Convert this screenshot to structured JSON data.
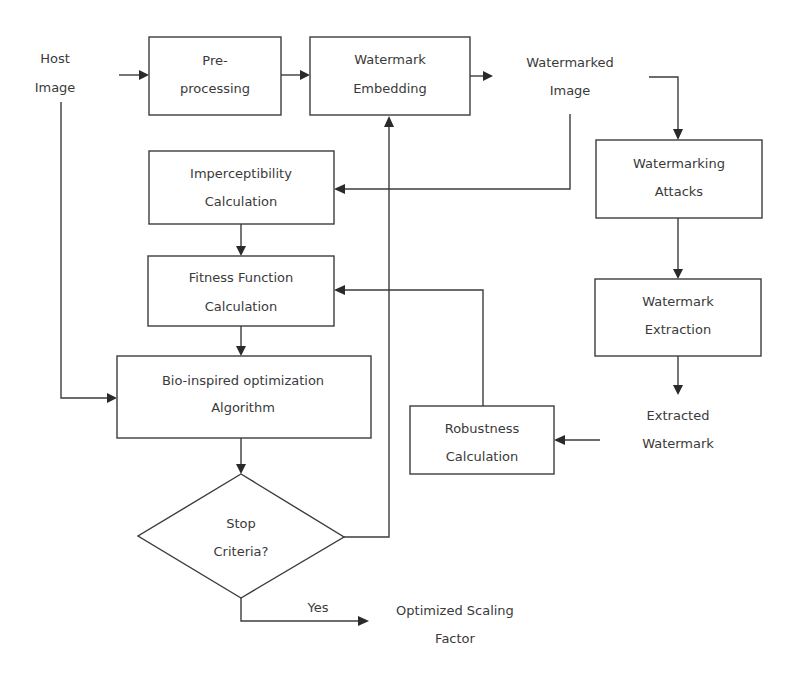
{
  "diagram": {
    "type": "flowchart",
    "colors": {
      "stroke": "#3c3c3c",
      "text": "#3a3a3a",
      "background": "#ffffff"
    },
    "nodes": {
      "host_image": {
        "line1": "Host",
        "line2": "Image"
      },
      "preprocessing": {
        "line1": "Pre-",
        "line2": "processing"
      },
      "watermark_embedding": {
        "line1": "Watermark",
        "line2": "Embedding"
      },
      "watermarked_image": {
        "line1": "Watermarked",
        "line2": "Image"
      },
      "imperceptibility": {
        "line1": "Imperceptibility",
        "line2": "Calculation"
      },
      "watermarking_attacks": {
        "line1": "Watermarking",
        "line2": "Attacks"
      },
      "fitness_function": {
        "line1": "Fitness Function",
        "line2": "Calculation"
      },
      "watermark_extraction": {
        "line1": "Watermark",
        "line2": "Extraction"
      },
      "bio_inspired": {
        "line1": "Bio-inspired optimization",
        "line2": "Algorithm"
      },
      "extracted_watermark": {
        "line1": "Extracted",
        "line2": "Watermark"
      },
      "robustness": {
        "line1": "Robustness",
        "line2": "Calculation"
      },
      "stop_criteria": {
        "line1": "Stop",
        "line2": "Criteria?"
      },
      "optimized_scaling_factor": {
        "line1": "Optimized Scaling",
        "line2": "Factor"
      }
    },
    "edge_labels": {
      "yes": "Yes"
    },
    "edges": [
      {
        "from": "Host Image",
        "to": "Pre-processing"
      },
      {
        "from": "Pre-processing",
        "to": "Watermark Embedding"
      },
      {
        "from": "Watermark Embedding",
        "to": "Watermarked Image"
      },
      {
        "from": "Watermarked Image",
        "to": "Watermarking Attacks"
      },
      {
        "from": "Watermarked Image",
        "to": "Imperceptibility Calculation"
      },
      {
        "from": "Imperceptibility Calculation",
        "to": "Fitness Function Calculation"
      },
      {
        "from": "Fitness Function Calculation",
        "to": "Bio-inspired optimization Algorithm"
      },
      {
        "from": "Host Image",
        "to": "Bio-inspired optimization Algorithm"
      },
      {
        "from": "Watermarking Attacks",
        "to": "Watermark Extraction"
      },
      {
        "from": "Watermark Extraction",
        "to": "Extracted Watermark"
      },
      {
        "from": "Extracted Watermark",
        "to": "Robustness Calculation"
      },
      {
        "from": "Robustness Calculation",
        "to": "Fitness Function Calculation"
      },
      {
        "from": "Bio-inspired optimization Algorithm",
        "to": "Stop Criteria?"
      },
      {
        "from": "Stop Criteria?",
        "to": "Watermark Embedding",
        "label": ""
      },
      {
        "from": "Stop Criteria?",
        "to": "Optimized Scaling Factor",
        "label": "Yes"
      }
    ]
  }
}
